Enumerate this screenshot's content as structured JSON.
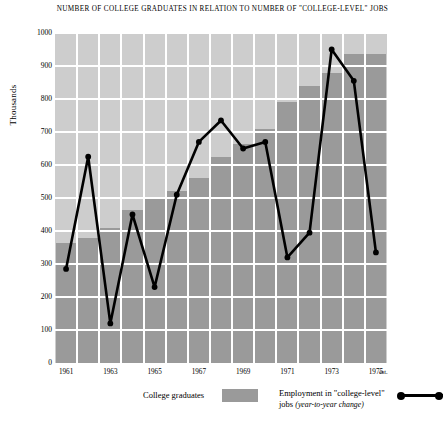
{
  "chart": {
    "title": "NUMBER OF COLLEGE GRADUATES IN RELATION TO NUMBER OF \"COLLEGE-LEVEL\" JOBS",
    "ylabel": "Thousands",
    "est_note": "est."
  },
  "legend": {
    "bars_label": "College graduates",
    "line_label_line1": "Employment in \"college-level\"",
    "line_label_line2": "jobs ",
    "line_label_italic": "(year-to-year change)"
  },
  "colors": {
    "bar_fill": "#9a9a9a",
    "plot_background": "#cdcdcd",
    "gridline": "#ffffff",
    "line": "#000000"
  },
  "chart_data": {
    "type": "bar",
    "title": "NUMBER OF COLLEGE GRADUATES IN RELATION TO NUMBER OF \"COLLEGE-LEVEL\" JOBS",
    "xlabel": "",
    "ylabel": "Thousands",
    "ylim": [
      0,
      1000
    ],
    "yticks": [
      0,
      100,
      200,
      300,
      400,
      500,
      600,
      700,
      800,
      900,
      1000
    ],
    "ytick_labels": [
      "0",
      "100",
      "200",
      "300",
      "400",
      "500",
      "600",
      "700",
      "800",
      "900",
      "1000"
    ],
    "categories": [
      "1961",
      "1962",
      "1963",
      "1964",
      "1965",
      "1966",
      "1967",
      "1968",
      "1969",
      "1970",
      "1971",
      "1972",
      "1973",
      "1974",
      "1975"
    ],
    "xtick_labels_shown": [
      "1961",
      "1963",
      "1965",
      "1967",
      "1969",
      "1971",
      "1973",
      "1975"
    ],
    "grid": true,
    "legend_position": "below",
    "series": [
      {
        "name": "College graduates",
        "type": "bar",
        "values": [
          365,
          380,
          410,
          465,
          500,
          520,
          560,
          625,
          665,
          710,
          790,
          840,
          880,
          935,
          935
        ]
      },
      {
        "name": "Employment in \"college-level\" jobs (year-to-year change)",
        "type": "line",
        "values": [
          285,
          625,
          120,
          450,
          230,
          510,
          670,
          735,
          650,
          670,
          320,
          395,
          950,
          855,
          335
        ]
      }
    ],
    "annotations": [
      "est. (1975 estimated)"
    ]
  }
}
